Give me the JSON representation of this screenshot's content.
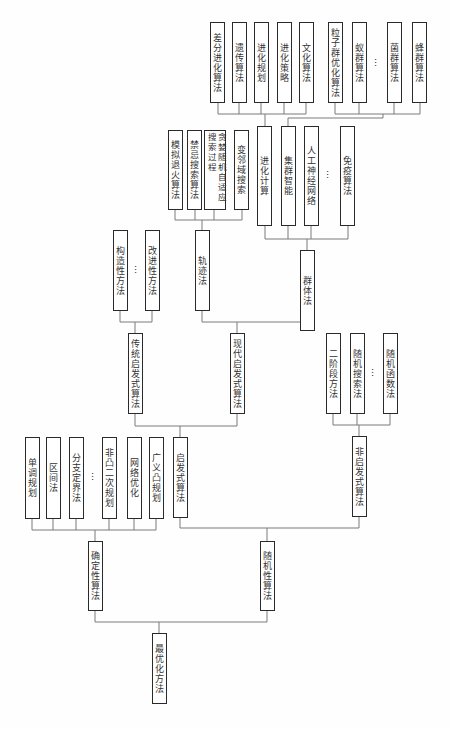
{
  "diagram": {
    "root": "最优化方法",
    "ellipsis": "…",
    "nodes": {
      "root": "最优化方法",
      "deterministic": "确定性算法",
      "stochastic": "随机性算法",
      "det_children": [
        "单调规划",
        "区间法",
        "分支定界法",
        "非凸二次规划",
        "网络优化",
        "广义凸规划"
      ],
      "heuristic": "启发式算法",
      "non_heuristic": "非启发式算法",
      "non_heuristic_children": [
        "二阶段方法",
        "随机搜索法",
        "随机函数法"
      ],
      "traditional": "传统启发式算法",
      "modern": "现代启发式算法",
      "traditional_children": [
        "构造性方法",
        "改进性方法"
      ],
      "trajectory": "轨迹法",
      "population": "群体法",
      "trajectory_children": [
        "模拟退火算法",
        "禁忌搜索算法",
        "贪婪随机自适应搜索过程",
        "变邻域搜索"
      ],
      "population_children": [
        "进化计算",
        "集群智能",
        "人工神经网络",
        "免疫算法"
      ],
      "evolutionary_children": [
        "差分进化算法",
        "遗传算法",
        "进化规划",
        "进化策略",
        "文化算法"
      ],
      "swarm_children": [
        "粒子群优化算法",
        "蚁群算法",
        "菌群算法",
        "蜂群算法"
      ]
    }
  }
}
